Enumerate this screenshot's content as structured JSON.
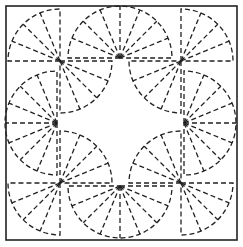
{
  "diagram": {
    "title": "",
    "stroke_color": "#222222",
    "background": "#ffffff",
    "frame": {
      "x": 6,
      "y": 6,
      "w": 231,
      "h": 234
    },
    "radius": 52,
    "fans": [
      {
        "id": "tl-a",
        "cx": 60,
        "cy": 61,
        "start": 180,
        "end": 270,
        "spokes": 3
      },
      {
        "id": "tl-b",
        "cx": 60,
        "cy": 61,
        "start": 0,
        "end": 90,
        "spokes": 3
      },
      {
        "id": "top",
        "cx": 120,
        "cy": 58,
        "start": 180,
        "end": 360,
        "spokes": 7
      },
      {
        "id": "tr-a",
        "cx": 181,
        "cy": 61,
        "start": 270,
        "end": 360,
        "spokes": 3
      },
      {
        "id": "tr-b",
        "cx": 181,
        "cy": 61,
        "start": 90,
        "end": 180,
        "spokes": 3
      },
      {
        "id": "left",
        "cx": 57,
        "cy": 123,
        "start": 90,
        "end": 270,
        "spokes": 7
      },
      {
        "id": "right",
        "cx": 184,
        "cy": 123,
        "start": -90,
        "end": 90,
        "spokes": 7
      },
      {
        "id": "bl-a",
        "cx": 60,
        "cy": 183,
        "start": 90,
        "end": 180,
        "spokes": 3
      },
      {
        "id": "bl-b",
        "cx": 60,
        "cy": 183,
        "start": 270,
        "end": 360,
        "spokes": 3
      },
      {
        "id": "bottom",
        "cx": 120,
        "cy": 186,
        "start": 0,
        "end": 180,
        "spokes": 7
      },
      {
        "id": "br-a",
        "cx": 181,
        "cy": 183,
        "start": 0,
        "end": 90,
        "spokes": 3
      },
      {
        "id": "br-b",
        "cx": 181,
        "cy": 183,
        "start": 180,
        "end": 270,
        "spokes": 3
      }
    ]
  }
}
